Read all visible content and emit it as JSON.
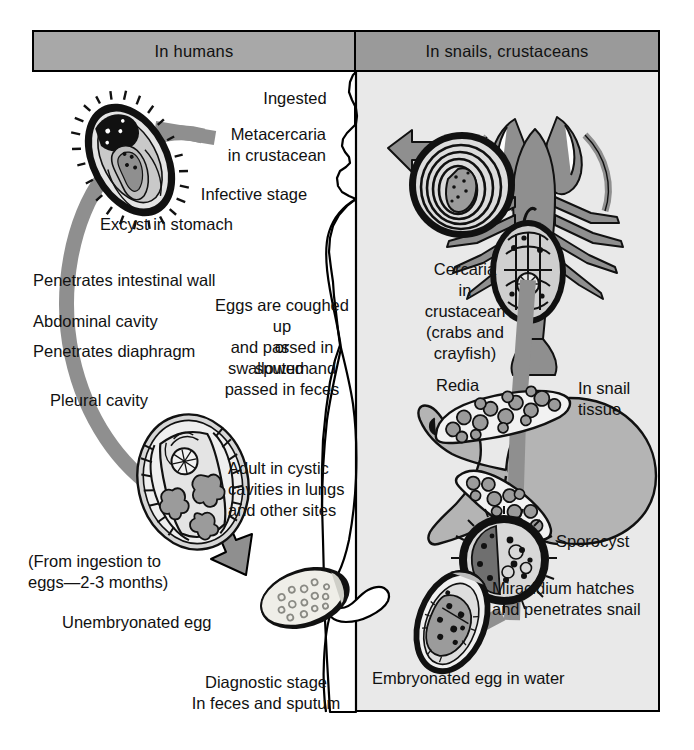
{
  "figure": {
    "type": "life-cycle-diagram",
    "colors": {
      "header_left_fill": "#a8a8a8",
      "header_right_fill": "#9a9a9a",
      "right_panel_fill": "#e9e9e9",
      "human_silhouette_fill": "#ffffff",
      "arrow_fill": "#8f8f8f",
      "organism_fill": "#9b9b9b",
      "outline": "#000000",
      "page_background": "#ffffff"
    }
  },
  "headers": {
    "left": "In humans",
    "right": "In snails, crustaceans"
  },
  "human_side": {
    "labels": [
      {
        "id": "ingested",
        "text": "Ingested"
      },
      {
        "id": "metacercaria",
        "text": "Metacercaria\nin crustacean"
      },
      {
        "id": "infective-stage",
        "text": "Infective stage"
      },
      {
        "id": "excyst",
        "text": "Excyst in stomach"
      },
      {
        "id": "penetrates-intestinal-wall",
        "text": "Penetrates intestinal wall"
      },
      {
        "id": "abdominal-cavity",
        "text": "Abdominal cavity"
      },
      {
        "id": "penetrates-diaphragm",
        "text": "Penetrates diaphragm"
      },
      {
        "id": "pleural-cavity",
        "text": "Pleural cavity"
      },
      {
        "id": "eggs-coughed",
        "text": "Eggs are coughed up\nand passed in sputum"
      },
      {
        "id": "or",
        "text": "or"
      },
      {
        "id": "swallowed",
        "text": "swallowed and\npassed in feces"
      },
      {
        "id": "adult",
        "text": "Adult in cystic\ncavities in lungs\nand other sites"
      },
      {
        "id": "duration",
        "text": "(From ingestion to\neggs—2-3 months)"
      },
      {
        "id": "unembryonated-egg",
        "text": "Unembryonated egg"
      },
      {
        "id": "diagnostic-stage",
        "text": "Diagnostic stage\nIn feces and sputum"
      }
    ]
  },
  "snail_side": {
    "labels": [
      {
        "id": "cercaria",
        "text": "Cercaria\nin\ncrustacean\n(crabs and\ncrayfish)"
      },
      {
        "id": "redia",
        "text": "Redia"
      },
      {
        "id": "in-snail-tissue",
        "text": "In snail\ntissue"
      },
      {
        "id": "sporocyst",
        "text": "Sporocyst"
      },
      {
        "id": "miracidium",
        "text": "Miracidium hatches\nand penetrates snail"
      },
      {
        "id": "embryonated-egg",
        "text": "Embryonated egg in water"
      }
    ]
  },
  "organisms": [
    {
      "id": "metacercaria-cyst-human",
      "name": "metacercaria cyst (spiny encysted larva)"
    },
    {
      "id": "adult-fluke",
      "name": "adult lung fluke with branched ceca"
    },
    {
      "id": "unembryonated-egg-art",
      "name": "unembryonated operculated egg"
    },
    {
      "id": "crayfish",
      "name": "crayfish / crustacean host"
    },
    {
      "id": "metacercaria-cyst-crayfish",
      "name": "encysted metacercaria in crustacean"
    },
    {
      "id": "cercaria-art",
      "name": "cercaria larva"
    },
    {
      "id": "snail",
      "name": "snail intermediate host"
    },
    {
      "id": "redia-art",
      "name": "redia larva with germ balls"
    },
    {
      "id": "sporocyst-art",
      "name": "sporocyst"
    },
    {
      "id": "miracidium-art",
      "name": "ciliated miracidium"
    },
    {
      "id": "embryonated-egg-art",
      "name": "embryonated egg containing miracidium"
    }
  ],
  "flow_arrows": [
    {
      "id": "arrow-human-cycle",
      "from": "metacercaria",
      "to": "adult-fluke",
      "direction": "clockwise-left-loop"
    },
    {
      "id": "arrow-to-egg",
      "from": "adult-fluke",
      "to": "unembryonated-egg",
      "direction": "down-right"
    },
    {
      "id": "arrow-to-human",
      "from": "crayfish",
      "to": "human-mouth",
      "direction": "left"
    },
    {
      "id": "arrow-snail-chain",
      "from": "embryonated-egg",
      "to": "cercaria",
      "direction": "up"
    }
  ]
}
